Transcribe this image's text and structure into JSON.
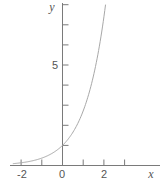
{
  "chart_data": {
    "type": "line",
    "title": "",
    "function": "y = e^x",
    "xlabel": "x",
    "ylabel": "y",
    "xlim": [
      -2.5,
      3.2
    ],
    "ylim": [
      0,
      8.1
    ],
    "x_ticks": [
      -2,
      -1,
      0,
      1,
      2,
      3
    ],
    "x_tick_labels": [
      {
        "value": -2,
        "label": "-2"
      },
      {
        "value": 0,
        "label": "0"
      },
      {
        "value": 2,
        "label": "2"
      }
    ],
    "y_ticks": [
      1,
      2,
      3,
      4,
      5,
      6,
      7,
      8
    ],
    "y_tick_labels": [
      {
        "value": 5,
        "label": "5"
      }
    ],
    "grid": false,
    "legend": null,
    "series": [
      {
        "name": "e^x",
        "color": "#a8a8a8",
        "x": [
          -2.4,
          -2,
          -1.5,
          -1,
          -0.5,
          0,
          0.5,
          1,
          1.5,
          2,
          2.08
        ],
        "y": [
          0.09,
          0.14,
          0.22,
          0.37,
          0.61,
          1.0,
          1.65,
          2.72,
          4.48,
          7.39,
          8.0
        ]
      }
    ]
  },
  "labels": {
    "x_axis": "x",
    "y_axis": "y",
    "tick_neg2": "-2",
    "tick_0": "0",
    "tick_2": "2",
    "tick_y5": "5"
  },
  "colors": {
    "axis": "#7a7a7a",
    "curve": "#a8a8a8",
    "text": "#555555",
    "background": "#ffffff"
  }
}
